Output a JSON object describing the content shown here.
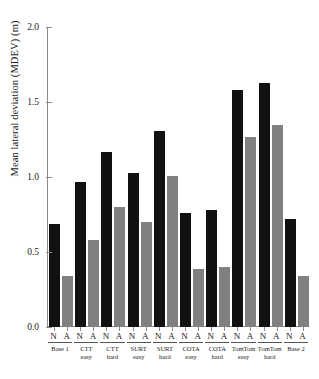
{
  "chart_data": {
    "type": "bar",
    "title": "",
    "xlabel": "",
    "ylabel": "Mean lateral deviation (MDEV) (m)",
    "ylim": [
      0.0,
      2.0
    ],
    "yticks": [
      "0.0",
      "0.5",
      "1.0",
      "1.5",
      "2.0"
    ],
    "ytick_values": [
      0.0,
      0.5,
      1.0,
      1.5,
      2.0
    ],
    "grid": false,
    "legend": "none",
    "categories": [
      "Base 1",
      "CTT easy",
      "CTT hard",
      "SURT easy",
      "SURT hard",
      "COTA easy",
      "COTA hard",
      "TomTom easy",
      "TomTom hard",
      "Base 2"
    ],
    "condition_labels": [
      "N",
      "A"
    ],
    "series": [
      {
        "name": "N",
        "color": "#111111",
        "values": [
          0.69,
          0.97,
          1.17,
          1.03,
          1.31,
          0.76,
          0.78,
          1.58,
          1.63,
          0.72
        ]
      },
      {
        "name": "A",
        "color": "#808080",
        "values": [
          0.34,
          0.58,
          0.8,
          0.7,
          1.01,
          0.39,
          0.4,
          1.27,
          1.35,
          0.34
        ]
      }
    ],
    "groups": [
      {
        "line1": "Base 1",
        "line2": "",
        "n": 0.69,
        "a": 0.34
      },
      {
        "line1": "CTT",
        "line2": "easy",
        "n": 0.97,
        "a": 0.58
      },
      {
        "line1": "CTT",
        "line2": "hard",
        "n": 1.17,
        "a": 0.8
      },
      {
        "line1": "SURT",
        "line2": "easy",
        "n": 1.03,
        "a": 0.7
      },
      {
        "line1": "SURT",
        "line2": "hard",
        "n": 1.31,
        "a": 1.01
      },
      {
        "line1": "COTA",
        "line2": "easy",
        "n": 0.76,
        "a": 0.39
      },
      {
        "line1": "COTA",
        "line2": "hard",
        "n": 0.78,
        "a": 0.4
      },
      {
        "line1": "TomTom",
        "line2": "easy",
        "n": 1.58,
        "a": 1.27
      },
      {
        "line1": "TomTom",
        "line2": "hard",
        "n": 1.63,
        "a": 1.35
      },
      {
        "line1": "Base 2",
        "line2": "",
        "n": 0.72,
        "a": 0.34
      }
    ]
  },
  "colors": {
    "series_n": "#111111",
    "series_a": "#808080",
    "axis": "#8a8a8a",
    "background": "#ffffff"
  }
}
